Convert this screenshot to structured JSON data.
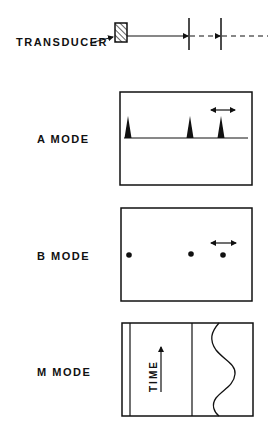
{
  "labels": {
    "transducer": "TRANSDUCER",
    "a_mode": "A MODE",
    "b_mode": "B MODE",
    "m_mode": "M MODE",
    "time": "TIME"
  },
  "colors": {
    "ink": "#111111",
    "background": "#ffffff"
  },
  "diagram": {
    "top": {
      "transducer_box": {
        "x": 115,
        "y": 23,
        "w": 12,
        "h": 19,
        "hatched": true
      },
      "beam_y": 36,
      "interfaces_x": [
        189,
        221
      ],
      "beam_style": [
        "solid-arrow",
        "dashed-arrow",
        "dashed"
      ]
    },
    "a_mode": {
      "panel": {
        "x": 120,
        "y": 92,
        "w": 132,
        "h": 93
      },
      "baseline_y": 138,
      "peaks_x": [
        128,
        190,
        221
      ],
      "peak_top_y": 116,
      "motion_arrow": {
        "x1": 210,
        "x2": 236,
        "y": 110
      }
    },
    "b_mode": {
      "panel": {
        "x": 121,
        "y": 208,
        "w": 131,
        "h": 93
      },
      "dots_y": 255,
      "dots_x": [
        129,
        191,
        223
      ],
      "motion_arrow": {
        "x1": 210,
        "x2": 237,
        "y": 243
      }
    },
    "m_mode": {
      "panel": {
        "x": 122,
        "y": 323,
        "w": 131,
        "h": 93
      },
      "inner_lines_x": [
        130,
        192
      ],
      "time_arrow": {
        "x": 161,
        "y1": 392,
        "y2": 346
      },
      "wave_points": [
        [
          218,
          323
        ],
        [
          213,
          345
        ],
        [
          235,
          372
        ],
        [
          214,
          400
        ],
        [
          218,
          416
        ]
      ]
    }
  }
}
